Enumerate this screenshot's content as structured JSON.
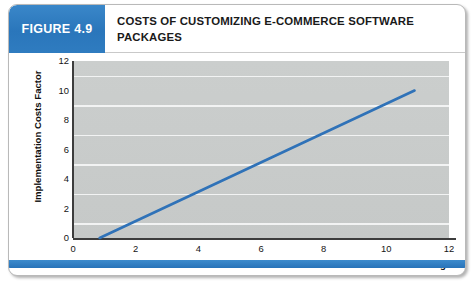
{
  "figure": {
    "badge_label": "FIGURE 4.9",
    "title": "COSTS OF CUSTOMIZING E-COMMERCE SOFTWARE PACKAGES",
    "badge_color": "#2e7cc0",
    "footer_color": "#2e7cc0"
  },
  "chart_data": {
    "type": "line",
    "title": "COSTS OF CUSTOMIZING E-COMMERCE SOFTWARE PACKAGES",
    "xlabel": "Percent Lines of Code Changed",
    "ylabel": "Implementation Costs Factor",
    "xlim": [
      0,
      12
    ],
    "ylim": [
      0,
      12
    ],
    "xticks": [
      0,
      2,
      4,
      6,
      8,
      10,
      12
    ],
    "yticks": [
      0,
      2,
      4,
      6,
      8,
      10,
      12
    ],
    "grid": "horizontal",
    "legend": "none",
    "plot_background": "#c9cccb",
    "gridline_color": "#f2f3f3",
    "series": [
      {
        "name": "Implementation cost",
        "color": "#2f72b8",
        "x": [
          0.85,
          10.9
        ],
        "y": [
          0,
          10
        ]
      }
    ]
  }
}
